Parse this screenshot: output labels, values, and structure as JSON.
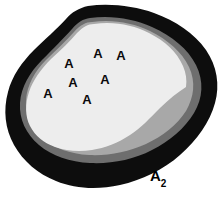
{
  "figure": {
    "title": "A2",
    "caption": {
      "base": "A",
      "subscript": "2",
      "x": 150,
      "y": 168
    },
    "background_color": "#ffffff",
    "zones": [
      {
        "name": "outer-dark-rind",
        "label": "outer dark zone",
        "color": "#0d0d0d"
      },
      {
        "name": "mid-gray-zone",
        "label": "medium gray zone",
        "color": "#6e6e6e"
      },
      {
        "name": "light-gray-zone",
        "label": "light gray zone",
        "color": "#a8a8a8"
      },
      {
        "name": "inner-pale-core",
        "label": "inner pale core",
        "color": "#ededed"
      }
    ],
    "markers": [
      {
        "label": "A",
        "x": 48,
        "y": 93
      },
      {
        "label": "A",
        "x": 69,
        "y": 63
      },
      {
        "label": "A",
        "x": 73,
        "y": 82
      },
      {
        "label": "A",
        "x": 87,
        "y": 99
      },
      {
        "label": "A",
        "x": 98,
        "y": 53
      },
      {
        "label": "A",
        "x": 105,
        "y": 79
      },
      {
        "label": "A",
        "x": 121,
        "y": 55
      }
    ]
  }
}
